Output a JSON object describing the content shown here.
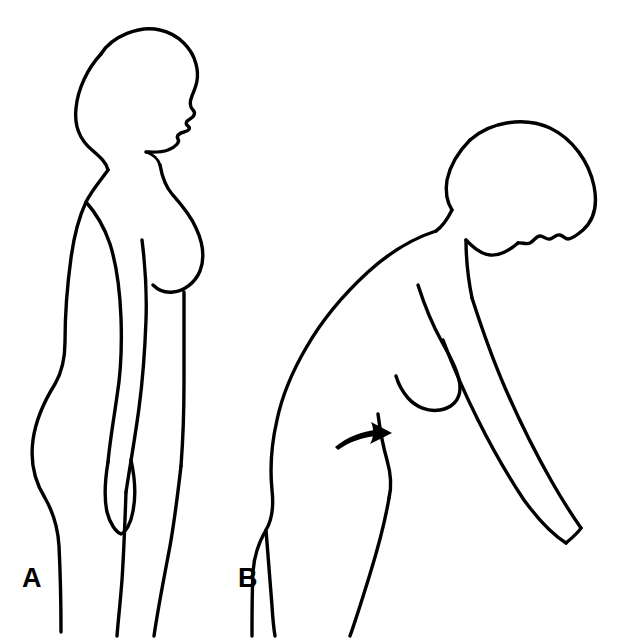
{
  "figure": {
    "kind": "medical-line-illustration",
    "background_color": "#ffffff",
    "stroke_color": "#000000",
    "width": 617,
    "height": 640,
    "panels": [
      {
        "id": "A",
        "label": "A",
        "posture": "upright standing, lateral profile facing right",
        "label_x": 22,
        "label_y": 565
      },
      {
        "id": "B",
        "label": "B",
        "posture": "trunk flexed forward, lateral profile facing right, arm hanging",
        "label_x": 238,
        "label_y": 565
      }
    ],
    "annotations": [
      {
        "type": "arrow",
        "name": "hip-shift-arrow",
        "direction": "right",
        "panel": "B",
        "meaning": "anterior pelvic / hip movement direction"
      }
    ]
  }
}
